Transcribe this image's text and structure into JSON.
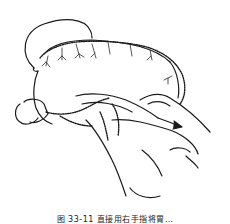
{
  "figure": {
    "arrow_direction": "right-down",
    "stroke_color": "#1a1a1a",
    "background_color": "#ffffff"
  },
  "caption": {
    "text": "图 33-11  直接用右手指将胃…"
  }
}
